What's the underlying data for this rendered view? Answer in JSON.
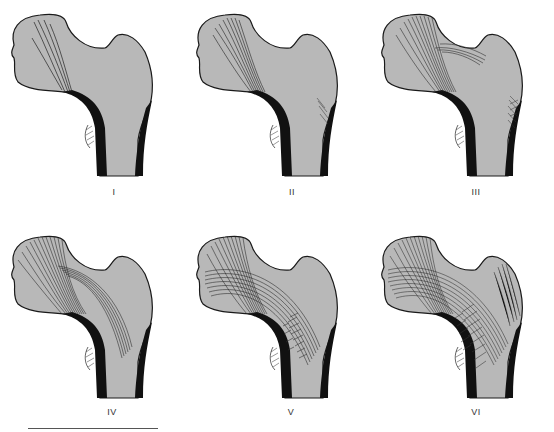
{
  "figure": {
    "panels": [
      {
        "id": "I",
        "label": "I"
      },
      {
        "id": "II",
        "label": "II"
      },
      {
        "id": "III",
        "label": "III"
      },
      {
        "id": "IV",
        "label": "IV"
      },
      {
        "id": "V",
        "label": "V"
      },
      {
        "id": "VI",
        "label": "VI"
      }
    ],
    "colors": {
      "bone_fill": "#b8b8b8",
      "cortex": "#111111",
      "outline": "#1a1a1a",
      "trabeculae": "#222222",
      "background": "#ffffff"
    }
  }
}
